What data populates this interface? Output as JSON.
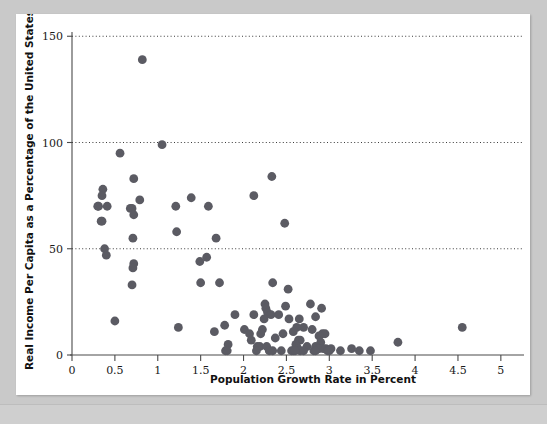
{
  "figure": {
    "background_color": "#c9c9c9",
    "card_color": "#ffffff",
    "dot_color": "#5b5b63"
  },
  "chart_data": {
    "type": "scatter",
    "title": "",
    "subtitle": "",
    "xlabel": "Population Growth Rate in Percent",
    "ylabel": "Real Income Per Capita as a Percentage of the United States",
    "xlim": [
      0,
      5.2
    ],
    "ylim": [
      0,
      152
    ],
    "xticks": [
      0,
      0.5,
      1,
      1.5,
      2,
      2.5,
      3,
      3.5,
      4,
      4.5,
      5
    ],
    "xtick_labels": [
      "0",
      "0.5",
      "1",
      "1.5",
      "2",
      "2.5",
      "3",
      "3.5",
      "4",
      "4.5",
      "5"
    ],
    "yticks": [
      0,
      50,
      100,
      150
    ],
    "ytick_labels": [
      "0",
      "50",
      "100",
      "150"
    ],
    "grid": "horizontal-dotted-at-50-100-150",
    "legend": "none",
    "marker": "filled-circle",
    "marker_size": 4.4,
    "points": [
      [
        0.82,
        139
      ],
      [
        1.05,
        99
      ],
      [
        0.56,
        95
      ],
      [
        0.72,
        83
      ],
      [
        0.36,
        78
      ],
      [
        0.35,
        75
      ],
      [
        0.79,
        73
      ],
      [
        1.39,
        74
      ],
      [
        2.12,
        75
      ],
      [
        2.33,
        84
      ],
      [
        0.3,
        70
      ],
      [
        0.31,
        70
      ],
      [
        0.41,
        70
      ],
      [
        0.68,
        69
      ],
      [
        0.7,
        69
      ],
      [
        1.21,
        70
      ],
      [
        1.59,
        70
      ],
      [
        0.72,
        66
      ],
      [
        0.34,
        63
      ],
      [
        0.35,
        63
      ],
      [
        2.48,
        62
      ],
      [
        1.22,
        58
      ],
      [
        0.71,
        55
      ],
      [
        1.68,
        55
      ],
      [
        0.38,
        50
      ],
      [
        0.4,
        47
      ],
      [
        0.72,
        43
      ],
      [
        0.71,
        41
      ],
      [
        1.49,
        44
      ],
      [
        1.57,
        46
      ],
      [
        0.7,
        33
      ],
      [
        1.5,
        34
      ],
      [
        1.72,
        34
      ],
      [
        2.34,
        34
      ],
      [
        2.52,
        31
      ],
      [
        2.25,
        24
      ],
      [
        2.26,
        22
      ],
      [
        2.78,
        24
      ],
      [
        2.91,
        22
      ],
      [
        2.49,
        23
      ],
      [
        2.28,
        20
      ],
      [
        2.12,
        19
      ],
      [
        2.32,
        19
      ],
      [
        2.41,
        19
      ],
      [
        2.53,
        17
      ],
      [
        2.65,
        17
      ],
      [
        2.84,
        18
      ],
      [
        1.9,
        19
      ],
      [
        2.24,
        17
      ],
      [
        0.5,
        16
      ],
      [
        1.24,
        13
      ],
      [
        1.78,
        14
      ],
      [
        2.01,
        12
      ],
      [
        2.22,
        12
      ],
      [
        2.62,
        13
      ],
      [
        2.7,
        13
      ],
      [
        2.8,
        12
      ],
      [
        4.55,
        13
      ],
      [
        1.66,
        11
      ],
      [
        2.07,
        10
      ],
      [
        2.2,
        10
      ],
      [
        2.46,
        10
      ],
      [
        2.58,
        11
      ],
      [
        2.92,
        10
      ],
      [
        2.95,
        10
      ],
      [
        2.88,
        9
      ],
      [
        2.09,
        7
      ],
      [
        2.37,
        8
      ],
      [
        2.64,
        7
      ],
      [
        2.66,
        7
      ],
      [
        2.9,
        6
      ],
      [
        3.8,
        6
      ],
      [
        1.82,
        5
      ],
      [
        2.16,
        4
      ],
      [
        2.19,
        4
      ],
      [
        2.27,
        4
      ],
      [
        2.61,
        5
      ],
      [
        2.62,
        4
      ],
      [
        2.63,
        3
      ],
      [
        2.74,
        4
      ],
      [
        2.84,
        4
      ],
      [
        2.86,
        3
      ],
      [
        2.88,
        3
      ],
      [
        2.93,
        3
      ],
      [
        2.96,
        3
      ],
      [
        3.02,
        3
      ],
      [
        1.79,
        2
      ],
      [
        1.81,
        2
      ],
      [
        2.15,
        2
      ],
      [
        2.3,
        2
      ],
      [
        2.34,
        2
      ],
      [
        2.44,
        2
      ],
      [
        2.58,
        2
      ],
      [
        2.66,
        2
      ],
      [
        2.7,
        2
      ],
      [
        2.82,
        2
      ],
      [
        2.84,
        2
      ],
      [
        2.98,
        2
      ],
      [
        3.0,
        2
      ],
      [
        3.13,
        2
      ],
      [
        3.26,
        3
      ],
      [
        3.35,
        2
      ],
      [
        3.48,
        2
      ],
      [
        2.56,
        2
      ],
      [
        2.6,
        2
      ]
    ]
  }
}
